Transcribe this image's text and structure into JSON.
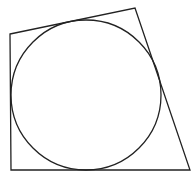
{
  "diagram": {
    "type": "tangential-quadrilateral",
    "quadrilateral": {
      "vertices": [
        [
          10,
          34
        ],
        [
          135,
          8
        ],
        [
          190,
          170
        ],
        [
          11,
          170
        ]
      ],
      "stroke": "#222222",
      "stroke_width": 1.3
    },
    "circle": {
      "cx": 86,
      "cy": 95,
      "r": 75,
      "stroke": "#222222",
      "stroke_width": 1.3
    },
    "bottom_edge_tint": "#b04050"
  }
}
